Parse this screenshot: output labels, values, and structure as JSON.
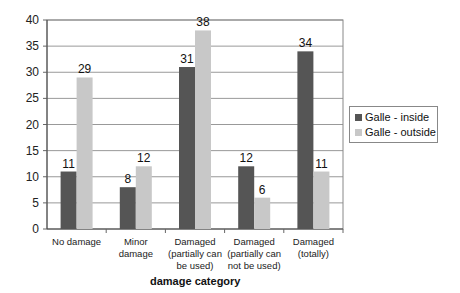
{
  "chart_data": {
    "type": "bar",
    "title": "",
    "xlabel": "damage category",
    "ylabel": "",
    "ylim": [
      0,
      40
    ],
    "yticks": [
      0,
      5,
      10,
      15,
      20,
      25,
      30,
      35,
      40
    ],
    "grid": true,
    "legend_position": "right",
    "categories": [
      [
        "No damage"
      ],
      [
        "Minor",
        "damage"
      ],
      [
        "Damaged",
        "(partially can",
        "be used)"
      ],
      [
        "Damaged",
        "(partially can",
        "not be used)"
      ],
      [
        "Damaged",
        "(totally)"
      ]
    ],
    "series": [
      {
        "name": "Galle - inside",
        "color": "#555555",
        "values": [
          11,
          8,
          31,
          12,
          34
        ]
      },
      {
        "name": "Galle - outside",
        "color": "#c8c8c8",
        "values": [
          29,
          12,
          38,
          6,
          11
        ]
      }
    ]
  },
  "legend": {
    "inside": "Galle - inside",
    "outside": "Galle - outside"
  },
  "axis": {
    "xtitle": "damage category"
  }
}
